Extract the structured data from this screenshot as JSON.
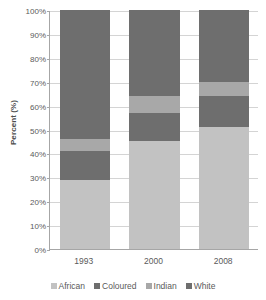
{
  "chart_data": {
    "type": "bar",
    "subtype": "100% stacked bar",
    "title": "",
    "xlabel": "",
    "ylabel": "Percent (%)",
    "ylim": [
      0,
      100
    ],
    "grid": true,
    "legend_position": "bottom",
    "categories": [
      "1993",
      "2000",
      "2008"
    ],
    "ytick_labels": [
      "0%",
      "10%",
      "20%",
      "30%",
      "40%",
      "50%",
      "60%",
      "70%",
      "80%",
      "90%",
      "100%"
    ],
    "ytick_values": [
      0,
      10,
      20,
      30,
      40,
      50,
      60,
      70,
      80,
      90,
      100
    ],
    "series": [
      {
        "name": "African",
        "color": "#c2c2c2",
        "values": [
          29,
          45,
          51
        ]
      },
      {
        "name": "Coloured",
        "color": "#6e6e6e",
        "values": [
          12,
          12,
          13
        ]
      },
      {
        "name": "Indian",
        "color": "#a8a8a8",
        "values": [
          5,
          7,
          6
        ]
      },
      {
        "name": "White",
        "color": "#6e6e6e",
        "values": [
          54,
          36,
          30
        ]
      }
    ]
  },
  "legend": {
    "items": [
      {
        "label": "African",
        "color": "#c2c2c2"
      },
      {
        "label": "Coloured",
        "color": "#6e6e6e"
      },
      {
        "label": "Indian",
        "color": "#a8a8a8"
      },
      {
        "label": "White",
        "color": "#6e6e6e"
      }
    ]
  },
  "axes": {
    "y_title": "Percent (%)"
  }
}
